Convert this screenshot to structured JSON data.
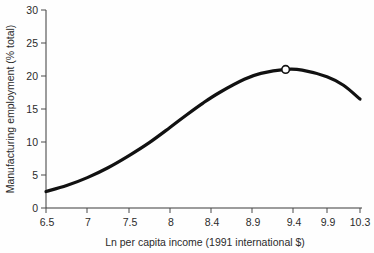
{
  "chart_data": {
    "type": "line",
    "title": "",
    "xlabel": "Ln per capita income (1991 international $)",
    "ylabel": "Manufacturing employment (% total)",
    "xlim": [
      6.5,
      10.3
    ],
    "ylim": [
      0,
      30
    ],
    "grid": false,
    "legend": "none",
    "xticks": [
      "6.5",
      "7",
      "7.5",
      "8",
      "8.4",
      "8.9",
      "9.4",
      "9.9",
      "10.3"
    ],
    "xtick_values": [
      6.5,
      7,
      7.5,
      8,
      8.4,
      8.9,
      9.4,
      9.9,
      10.3
    ],
    "yticks": [
      "0",
      "5",
      "10",
      "15",
      "20",
      "25",
      "30"
    ],
    "ytick_values": [
      0,
      5,
      10,
      15,
      20,
      25,
      30
    ],
    "series": [
      {
        "name": "Manufacturing employment",
        "x": [
          6.5,
          6.75,
          7.0,
          7.25,
          7.5,
          7.75,
          8.0,
          8.2,
          8.4,
          8.6,
          8.9,
          9.1,
          9.4,
          9.6,
          9.9,
          10.1,
          10.3
        ],
        "y": [
          2.5,
          3.4,
          4.6,
          6.1,
          7.9,
          9.9,
          12.2,
          14.1,
          15.9,
          17.5,
          19.5,
          20.4,
          21.0,
          20.9,
          19.9,
          18.6,
          16.5
        ]
      }
    ],
    "annotations": [
      {
        "type": "point-marker",
        "shape": "open-circle",
        "x": 9.4,
        "y": 21.0,
        "label": ""
      }
    ]
  },
  "axes": {
    "y_axis_title": "Manufacturing employment (% total)",
    "x_axis_title": "Ln per capita income (1991 international $)"
  },
  "colors": {
    "curve": "#111111",
    "axis": "#3a3a3a",
    "text": "#2b2b2b",
    "background": "#fefefe",
    "marker_fill": "#ffffff"
  }
}
